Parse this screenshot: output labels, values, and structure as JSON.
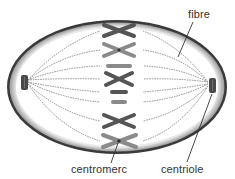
{
  "diagram": {
    "labels": {
      "fibre": "fibre",
      "centromere": "centromerc",
      "centriole": "centriole"
    },
    "colors": {
      "membrane_dark": "#3a3a3a",
      "membrane_light": "#d8d8d8",
      "chromosome_dark": "#555555",
      "chromosome_light": "#8a8a8a",
      "fibre": "#8c8c8c",
      "centriole": "#4a4a4a",
      "leader_line": "#333333"
    },
    "chromosomes": [
      {
        "y": 31,
        "shape": "x",
        "tone": "dark"
      },
      {
        "y": 50,
        "shape": "x",
        "tone": "light"
      },
      {
        "y": 66,
        "shape": "bar",
        "tone": "light"
      },
      {
        "y": 79,
        "shape": "x",
        "tone": "dark"
      },
      {
        "y": 92,
        "shape": "bar",
        "tone": "dark"
      },
      {
        "y": 102,
        "shape": "bar",
        "tone": "light"
      },
      {
        "y": 121,
        "shape": "x",
        "tone": "dark"
      },
      {
        "y": 141,
        "shape": "x",
        "tone": "light"
      }
    ]
  }
}
